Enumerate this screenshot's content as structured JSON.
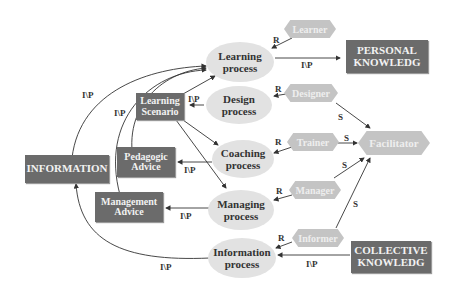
{
  "diagram": {
    "processes": {
      "learning": "Learning process",
      "design": "Design process",
      "coaching": "Coaching process",
      "managing": "Managing process",
      "information": "Information process"
    },
    "roles": {
      "learner": "Learner",
      "designer": "Designer",
      "trainer": "Trainer",
      "manager": "Manager",
      "informer": "Informer",
      "facilitator": "Facilitator"
    },
    "artifacts": {
      "personal_knowledge": "PERSONAL KNOWLEDG",
      "collective_knowledge": "COLLECTIVE KNOWLEDG",
      "information": "INFORMATION",
      "learning_scenario": "Learning Scenario",
      "pedagogic_advice": "Pedagogic Advice",
      "management_advice": "Management Advice"
    },
    "edge_labels": {
      "role": "R",
      "support": "S",
      "input_product": "I\\P"
    },
    "colors": {
      "artifact_box": "#6b6b6b",
      "process_ellipse": "#e2e2e2",
      "role_hexagon": "#c4c4c4",
      "edge": "#333333"
    }
  }
}
